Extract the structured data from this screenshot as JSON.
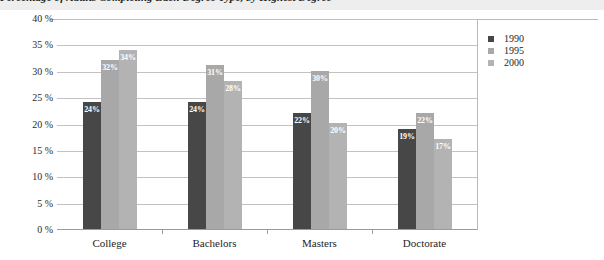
{
  "chart_data": {
    "type": "bar",
    "title": "Percentage of Adults Completing Each Degree Type, by Highest Degree",
    "xlabel": "",
    "ylabel": "",
    "categories": [
      "College",
      "Bachelors",
      "Masters",
      "Doctorate"
    ],
    "series": [
      {
        "name": "1990",
        "color": "#474747",
        "values": [
          24,
          24,
          22,
          19
        ]
      },
      {
        "name": "1995",
        "color": "#a8a8a8",
        "values": [
          32,
          31,
          30,
          22
        ]
      },
      {
        "name": "2000",
        "color": "#b3b3b3",
        "values": [
          34,
          28,
          20,
          17
        ]
      }
    ],
    "value_labels": [
      [
        "24%",
        "32%",
        "34%"
      ],
      [
        "24%",
        "31%",
        "28%"
      ],
      [
        "22%",
        "30%",
        "20%"
      ],
      [
        "19%",
        "22%",
        "17%"
      ]
    ],
    "ylim": [
      0,
      40
    ],
    "yticks": [
      "0 %",
      "5 %",
      "10 %",
      "15 %",
      "20 %",
      "25 %",
      "30 %",
      "35 %",
      "40 %"
    ],
    "ytick_values": [
      0,
      5,
      10,
      15,
      20,
      25,
      30,
      35,
      40
    ],
    "grid": true,
    "legend_position": "right",
    "legend_entries": [
      "1990",
      "1995",
      "2000"
    ]
  },
  "colors": {
    "background": "#eeeeee",
    "plot_background": "#ffffff",
    "gridline": "#c2c2c2",
    "axis": "#9a9a9a",
    "text": "#1e1e1e",
    "value_label": "#ffffff"
  }
}
